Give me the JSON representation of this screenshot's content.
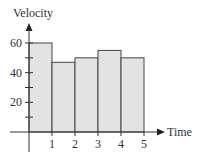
{
  "chart_data": {
    "type": "bar",
    "title": "",
    "xlabel": "Time",
    "ylabel": "Velocity",
    "categories": [
      "0-1",
      "1-2",
      "2-3",
      "3-4",
      "4-5"
    ],
    "bin_edges": [
      0,
      1,
      2,
      3,
      4,
      5
    ],
    "values": [
      60,
      47,
      50,
      55,
      50
    ],
    "x_ticks": [
      "1",
      "2",
      "3",
      "4",
      "5"
    ],
    "y_ticks": [
      "20",
      "40",
      "60"
    ],
    "y_minor_ticks": [
      10,
      30,
      50
    ],
    "xlim": [
      0,
      5.8
    ],
    "ylim": [
      0,
      70
    ],
    "grid": false,
    "legend": null,
    "bar_fill": "#e3e3e3",
    "bar_stroke": "#444444"
  }
}
